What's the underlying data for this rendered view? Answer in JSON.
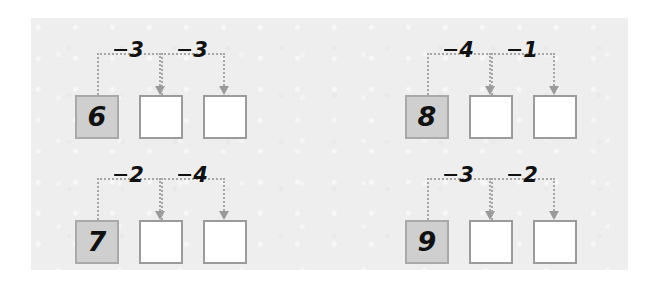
{
  "worksheet": {
    "title": "Subtraction chain worksheet",
    "background_color": "#ffffff",
    "paper_color": "#eeeeee",
    "start_box_color": "#cfcfcf",
    "empty_box_color": "#ffffff",
    "box_border_color": "#9b9b9b",
    "connector_color": "#a6a6a6",
    "ink_color": "#111111"
  },
  "problems": [
    {
      "id": "problem-1",
      "start_value": "6",
      "steps": [
        {
          "operator": "−",
          "operand": "3",
          "label": "−3"
        },
        {
          "operator": "−",
          "operand": "3",
          "label": "−3"
        }
      ],
      "answers": [
        "",
        ""
      ]
    },
    {
      "id": "problem-2",
      "start_value": "8",
      "steps": [
        {
          "operator": "−",
          "operand": "4",
          "label": "−4"
        },
        {
          "operator": "−",
          "operand": "1",
          "label": "−1"
        }
      ],
      "answers": [
        "",
        ""
      ]
    },
    {
      "id": "problem-3",
      "start_value": "7",
      "steps": [
        {
          "operator": "−",
          "operand": "2",
          "label": "−2"
        },
        {
          "operator": "−",
          "operand": "4",
          "label": "−4"
        }
      ],
      "answers": [
        "",
        ""
      ]
    },
    {
      "id": "problem-4",
      "start_value": "9",
      "steps": [
        {
          "operator": "−",
          "operand": "3",
          "label": "−3"
        },
        {
          "operator": "−",
          "operand": "2",
          "label": "−2"
        }
      ],
      "answers": [
        "",
        ""
      ]
    }
  ]
}
